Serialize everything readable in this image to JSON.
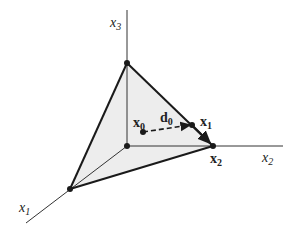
{
  "diagram": {
    "type": "3d-simplex-with-descent-direction",
    "axes": [
      {
        "name": "x1",
        "label": "x",
        "sub": "1"
      },
      {
        "name": "x2",
        "label": "x",
        "sub": "2"
      },
      {
        "name": "x3",
        "label": "x",
        "sub": "3"
      }
    ],
    "points": [
      {
        "name": "x0",
        "label": "x",
        "sub": "0"
      },
      {
        "name": "x1",
        "label": "x",
        "sub": "1"
      },
      {
        "name": "x2",
        "label": "x",
        "sub": "2"
      }
    ],
    "direction": {
      "name": "d0",
      "label": "d",
      "sub": "0"
    },
    "colors": {
      "face_fill": "#ededed",
      "edge": "#1a1a1a",
      "axis": "#333333"
    }
  }
}
